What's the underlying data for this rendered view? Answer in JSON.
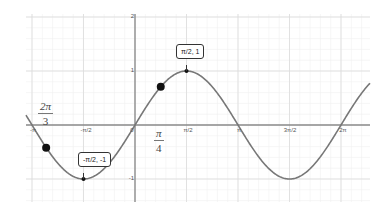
{
  "chart_data": {
    "type": "line",
    "title": "",
    "function": "y = sin(x)",
    "xlabel": "",
    "ylabel": "",
    "x_ticks": [
      {
        "value": -3.14159,
        "label": "-π"
      },
      {
        "value": -1.5708,
        "label": "-π/2"
      },
      {
        "value": 0,
        "label": "0"
      },
      {
        "value": 1.5708,
        "label": "π/2"
      },
      {
        "value": 3.14159,
        "label": "π"
      },
      {
        "value": 4.71239,
        "label": "3π/2"
      },
      {
        "value": 6.28319,
        "label": "2π"
      }
    ],
    "y_ticks": [
      {
        "value": 2,
        "label": "2"
      },
      {
        "value": 1,
        "label": "1"
      },
      {
        "value": -1,
        "label": "-1"
      }
    ],
    "xlim": [
      -3.35,
      7.15
    ],
    "ylim": [
      -1.4,
      2.0
    ],
    "grid": true,
    "highlighted_points": [
      {
        "x": 1.5708,
        "y": 1,
        "label": "π/2, 1",
        "style": "small"
      },
      {
        "x": -1.5708,
        "y": -1,
        "label": "-π/2, -1",
        "style": "small"
      },
      {
        "x": 0.7854,
        "y": 0.7071,
        "label": "",
        "style": "large"
      },
      {
        "x": -2.71,
        "y": -0.42,
        "label": "",
        "style": "large"
      }
    ],
    "annotations": [
      {
        "text_num": "2π",
        "text_den": "3",
        "near": "left of y-axis above x-axis"
      },
      {
        "text_num": "π",
        "text_den": "4",
        "near": "right of origin below x-axis"
      }
    ],
    "curve_color": "#777777",
    "axis_color": "#888888",
    "grid_color": "#e6e6e6"
  },
  "labels": {
    "peak": "π/2, 1",
    "trough": "-π/2, -1",
    "frac_left_num": "2π",
    "frac_left_den": "3",
    "frac_right_num": "π",
    "frac_right_den": "4",
    "xt_negpi": "-π",
    "xt_neghalfpi": "-π/2",
    "xt_zero": "0",
    "xt_halfpi": "π/2",
    "xt_pi": "π",
    "xt_3halfpi": "3π/2",
    "xt_2pi": "2π",
    "yt_2": "2",
    "yt_1": "1",
    "yt_neg1": "-1"
  }
}
